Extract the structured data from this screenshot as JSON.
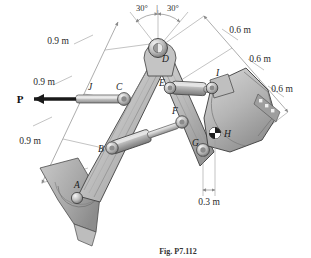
{
  "figure": {
    "caption": "Fig. P7.112",
    "background_color": "#ffffff"
  },
  "force": {
    "label": "P",
    "direction": "left",
    "applied_at_joint": "J"
  },
  "dimensions": {
    "left_chain": [
      {
        "id": "dim-0-9-m-upper",
        "label": "0.9 m"
      },
      {
        "id": "dim-0-9-m-middle",
        "label": "0.9 m"
      },
      {
        "id": "dim-0-9-m-lower",
        "label": "0.9 m"
      }
    ],
    "right_chain": [
      {
        "id": "dim-0-6-m-upper",
        "label": "0.6 m"
      },
      {
        "id": "dim-0-6-m-middle",
        "label": "0.6 m"
      },
      {
        "id": "dim-0-6-m-lower",
        "label": "0.6 m"
      }
    ],
    "bucket_base": {
      "id": "dim-0-3-m",
      "label": "0.3 m"
    }
  },
  "angles": [
    {
      "id": "angle-left",
      "label": "30°"
    },
    {
      "id": "angle-right",
      "label": "30°"
    }
  ],
  "angle_separator": "|",
  "joints": [
    {
      "id": "A",
      "label": "A",
      "role": "base-pivot"
    },
    {
      "id": "B",
      "label": "B",
      "role": "boom-cylinder-pin"
    },
    {
      "id": "C",
      "label": "C",
      "role": "lift-cylinder-pin"
    },
    {
      "id": "D",
      "label": "D",
      "role": "boom-top-pivot"
    },
    {
      "id": "E",
      "label": "E",
      "role": "stick-cylinder-pin"
    },
    {
      "id": "F",
      "label": "F",
      "role": "stick-mid-pin"
    },
    {
      "id": "G",
      "label": "G",
      "role": "bucket-pivot"
    },
    {
      "id": "H",
      "label": "H",
      "role": "bucket-center-of-gravity"
    },
    {
      "id": "I",
      "label": "I",
      "role": "bucket-link-pin"
    },
    {
      "id": "J",
      "label": "J",
      "role": "force-application-point"
    }
  ],
  "colors": {
    "metal_light": "#d4d4d4",
    "metal_mid": "#b3b3b3",
    "metal_dark": "#8c8c8c",
    "outline": "#3a3a3a",
    "dimension_line": "#8a8a8a",
    "text": "#2b2b2b",
    "force_arrow": "#1a1a1a"
  }
}
